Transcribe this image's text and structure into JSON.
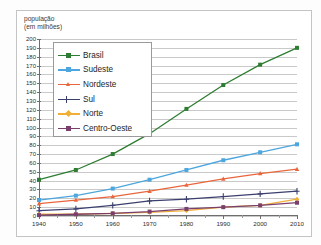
{
  "figure": {
    "top_strip_text": "",
    "credit": "Gráficos: Allmaps/Arquivo da editora",
    "y_axis_title_line1": "população",
    "y_axis_title_line2": "(em milhões)"
  },
  "legend": {
    "items": [
      {
        "label": "Brasil",
        "color": "#2e7d32"
      },
      {
        "label": "Sudeste",
        "color": "#4da6dd"
      },
      {
        "label": "Nordeste",
        "color": "#e8663c"
      },
      {
        "label": "Sul",
        "color": "#3b3f6e"
      },
      {
        "label": "Norte",
        "color": "#f0b038"
      },
      {
        "label": "Centro-Oeste",
        "color": "#7a3f6d"
      }
    ]
  },
  "chart_data": {
    "type": "line",
    "title": "",
    "xlabel": "",
    "ylabel": "população (em milhões)",
    "xlim": [
      1940,
      2010
    ],
    "ylim": [
      0,
      200
    ],
    "ytick_step": 10,
    "grid": true,
    "legend_position": "upper-left-inset",
    "x": [
      1940,
      1950,
      1960,
      1970,
      1980,
      1990,
      2000,
      2010
    ],
    "xtick_labels": [
      "1940",
      "1950",
      "1960",
      "1970",
      "1980",
      "1990",
      "2000",
      "2010"
    ],
    "ytick_labels": [
      "0",
      "10",
      "20",
      "30",
      "40",
      "50",
      "60",
      "70",
      "80",
      "90",
      "100",
      "110",
      "120",
      "130",
      "140",
      "150",
      "160",
      "170",
      "180",
      "190",
      "200"
    ],
    "series": [
      {
        "name": "Brasil",
        "color": "#2e7d32",
        "marker": "square",
        "values": [
          41,
          52,
          70,
          93,
          121,
          148,
          171,
          190
        ]
      },
      {
        "name": "Sudeste",
        "color": "#4da6dd",
        "marker": "square",
        "values": [
          18,
          23,
          31,
          41,
          52,
          63,
          72,
          81
        ]
      },
      {
        "name": "Nordeste",
        "color": "#e8663c",
        "marker": "triangle",
        "values": [
          14,
          18,
          22,
          28,
          35,
          42,
          48,
          53
        ]
      },
      {
        "name": "Sul",
        "color": "#3b3f6e",
        "marker": "plus",
        "values": [
          6,
          8,
          12,
          17,
          19,
          22,
          25,
          28
        ]
      },
      {
        "name": "Norte",
        "color": "#f0b038",
        "marker": "diamond",
        "values": [
          2,
          2,
          3,
          4,
          6,
          10,
          12,
          19
        ]
      },
      {
        "name": "Centro-Oeste",
        "color": "#7a3f6d",
        "marker": "square",
        "values": [
          1,
          2,
          3,
          5,
          8,
          10,
          12,
          15
        ]
      }
    ]
  }
}
